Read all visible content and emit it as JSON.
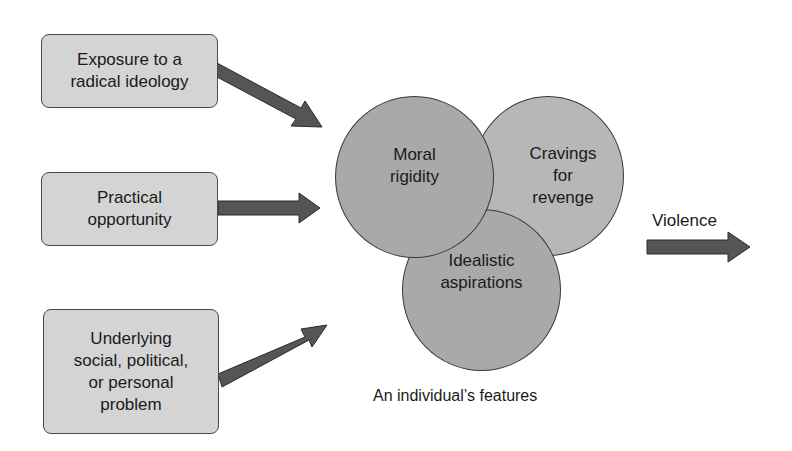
{
  "inputs": [
    {
      "id": "exposure",
      "lines": [
        "Exposure to a",
        "radical ideology"
      ]
    },
    {
      "id": "opportunity",
      "lines": [
        "Practical",
        "opportunity"
      ]
    },
    {
      "id": "problem",
      "lines": [
        "Underlying",
        "social, political,",
        "or personal",
        "problem"
      ]
    }
  ],
  "features": [
    {
      "id": "moral",
      "lines": [
        "Moral",
        "rigidity"
      ]
    },
    {
      "id": "revenge",
      "lines": [
        "Cravings",
        "for",
        "revenge"
      ]
    },
    {
      "id": "idealistic",
      "lines": [
        "Idealistic",
        "aspirations"
      ]
    }
  ],
  "features_caption": "An individual’s features",
  "output": {
    "label": "Violence"
  },
  "colors": {
    "box_fill": "#d4d4d4",
    "circle_fill_dark": "#a9a9a9",
    "circle_fill_light": "#b7b7b7",
    "arrow_fill": "#555555",
    "outline": "#3a3a3a"
  }
}
